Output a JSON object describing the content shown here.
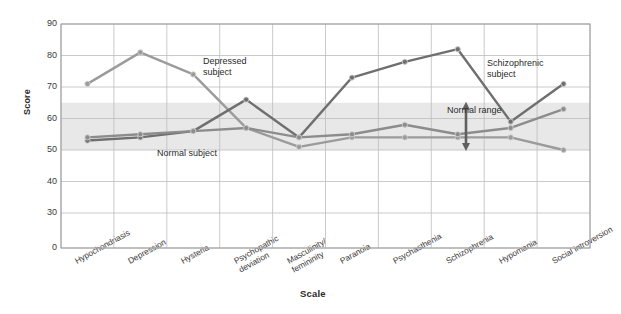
{
  "chart_data": {
    "type": "line",
    "title": "",
    "xlabel": "Scale",
    "ylabel": "Score",
    "categories": [
      "Hypochondriasis",
      "Depression",
      "Hysteria",
      "Psychopathic\ndeviation",
      "Masculinity/\nfemininity",
      "Paranoia",
      "Psychasthenia",
      "Schizophrenia",
      "Hypomania",
      "Social introversion"
    ],
    "yticks": [
      90,
      80,
      70,
      60,
      50,
      40,
      30,
      0
    ],
    "ylim": [
      0,
      90
    ],
    "grid": true,
    "legend_position": "inline-annotations",
    "series": [
      {
        "name": "Depressed subject",
        "color": "#9b9b9b",
        "values": [
          71,
          81,
          74,
          57,
          51,
          54,
          54,
          54,
          54,
          50
        ]
      },
      {
        "name": "Schizophrenic subject",
        "color": "#6f6f6f",
        "values": [
          53,
          54,
          56,
          66,
          54,
          73,
          78,
          82,
          59,
          71
        ]
      },
      {
        "name": "Normal subject",
        "color": "#8c8c8c",
        "values": [
          54,
          55,
          56,
          57,
          54,
          55,
          58,
          55,
          57,
          63
        ]
      }
    ],
    "bands": [
      {
        "label": "Normal range",
        "from": 50,
        "to": 65,
        "color": "#e8e8e8"
      }
    ],
    "annotations": [
      {
        "name": "depressed-subject-label",
        "text": "Depressed\nsubject"
      },
      {
        "name": "schizophrenic-subject-label",
        "text": "Schizophrenic\nsubject"
      },
      {
        "name": "normal-subject-label",
        "text": "Normal subject"
      },
      {
        "name": "normal-range-label",
        "text": "Normal range"
      }
    ]
  },
  "axis": {
    "y_title": "Score",
    "x_title": "Scale",
    "y_tick_labels": [
      "90",
      "80",
      "70",
      "60",
      "50",
      "40",
      "30",
      "0"
    ]
  },
  "labels": {
    "depressed": "Depressed\nsubject",
    "schizophrenic": "Schizophrenic\nsubject",
    "normal_subject": "Normal subject",
    "normal_range": "Normal range"
  }
}
